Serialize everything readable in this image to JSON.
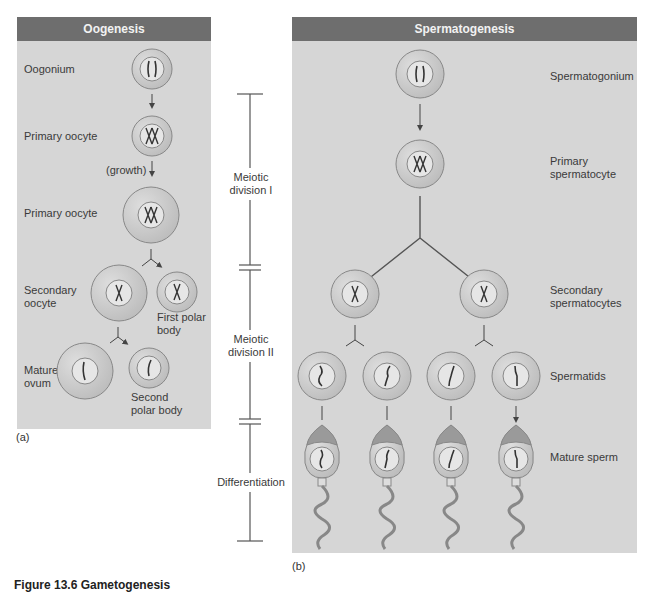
{
  "oogenesis": {
    "title": "Oogenesis",
    "labels": {
      "oogonium": "Oogonium",
      "primary_oocyte_1": "Primary oocyte",
      "growth": "(growth)",
      "primary_oocyte_2": "Primary oocyte",
      "secondary_oocyte": "Secondary oocyte",
      "first_polar_body": "First polar body",
      "mature_ovum": "Mature ovum",
      "second_polar_body": "Second polar body"
    },
    "panel_tag": "(a)"
  },
  "stages": {
    "meiotic_division_1": "Meiotic division I",
    "meiotic_division_2": "Meiotic division II",
    "differentiation": "Differentiation"
  },
  "spermatogenesis": {
    "title": "Spermatogenesis",
    "labels": {
      "spermatogonium": "Spermatogonium",
      "primary_spermatocyte": "Primary spermatocyte",
      "secondary_spermatocytes": "Secondary spermatocytes",
      "spermatids": "Spermatids",
      "mature_sperm": "Mature sperm"
    },
    "panel_tag": "(b)"
  },
  "caption": "Figure 13.6 Gametogenesis",
  "colors": {
    "panel_bg": "#d6d6d6",
    "header_bg": "#6e6e6e",
    "cell_fill": "#cfcfcf",
    "nucleus_fill": "#e6e6e6",
    "line": "#555555"
  }
}
